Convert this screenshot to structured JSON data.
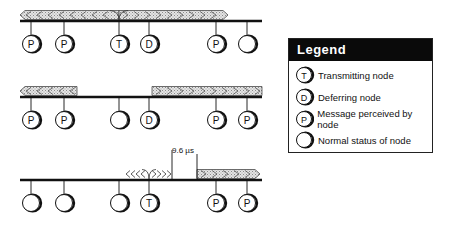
{
  "diagram": {
    "rows": [
      {
        "id": "row1",
        "description": "Transmitting node T sends; signal propagates both directions",
        "nodes": [
          {
            "label": "P",
            "status": "perceived"
          },
          {
            "label": "P",
            "status": "perceived"
          },
          {
            "label": "T",
            "status": "transmitting"
          },
          {
            "label": "D",
            "status": "deferring"
          },
          {
            "label": "P",
            "status": "perceived"
          },
          {
            "label": "",
            "status": "normal"
          }
        ],
        "signals": [
          {
            "direction": "left"
          },
          {
            "direction": "right"
          }
        ]
      },
      {
        "id": "row2",
        "description": "Transmission ended; tail of signal travels outward",
        "nodes": [
          {
            "label": "P",
            "status": "perceived"
          },
          {
            "label": "P",
            "status": "perceived"
          },
          {
            "label": "",
            "status": "normal"
          },
          {
            "label": "D",
            "status": "deferring"
          },
          {
            "label": "P",
            "status": "perceived"
          },
          {
            "label": "P",
            "status": "perceived"
          }
        ],
        "signals": [
          {
            "direction": "left"
          },
          {
            "direction": "right"
          }
        ]
      },
      {
        "id": "row3",
        "description": "Deferring node starts transmitting after interframe gap",
        "nodes": [
          {
            "label": "",
            "status": "normal"
          },
          {
            "label": "",
            "status": "normal"
          },
          {
            "label": "",
            "status": "normal"
          },
          {
            "label": "T",
            "status": "transmitting"
          },
          {
            "label": "P",
            "status": "perceived"
          },
          {
            "label": "P",
            "status": "perceived"
          }
        ],
        "signals": [
          {
            "direction": "both"
          },
          {
            "direction": "right"
          }
        ],
        "gap_label": "9.6 µs"
      }
    ]
  },
  "legend": {
    "title": "Legend",
    "items": [
      {
        "symbol": "T",
        "label": "Transmitting node"
      },
      {
        "symbol": "D",
        "label": "Deferring node"
      },
      {
        "symbol": "P",
        "label": "Message perceived by node"
      },
      {
        "symbol": "",
        "label": "Normal status of node"
      }
    ]
  },
  "colors": {
    "bus": "#111111",
    "signal_fill": "#cfcfcf",
    "legend_header_bg": "#0a0a0a",
    "legend_header_text": "#ffffff"
  }
}
